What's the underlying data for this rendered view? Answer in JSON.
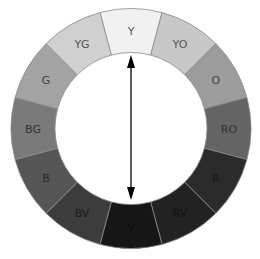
{
  "diagram": {
    "center": [
      131,
      128.5
    ],
    "outer_radius": 120,
    "inner_radius": 76,
    "segments": [
      {
        "label": "Y",
        "fill": "#f1f1f1",
        "text": "#555555"
      },
      {
        "label": "YO",
        "fill": "#c8c8c8",
        "text": "#555555"
      },
      {
        "label": "O",
        "fill": "#9c9c9c",
        "text": "#444444"
      },
      {
        "label": "RO",
        "fill": "#646464",
        "text": "#333333"
      },
      {
        "label": "R",
        "fill": "#2b2b2b",
        "text": "#151515"
      },
      {
        "label": "RV",
        "fill": "#222222",
        "text": "#111111"
      },
      {
        "label": "V",
        "fill": "#161616",
        "text": "#0a0a0a"
      },
      {
        "label": "BV",
        "fill": "#3c3c3c",
        "text": "#1c1c1c"
      },
      {
        "label": "B",
        "fill": "#555555",
        "text": "#2a2a2a"
      },
      {
        "label": "BG",
        "fill": "#7a7a7a",
        "text": "#333333"
      },
      {
        "label": "G",
        "fill": "#a3a3a3",
        "text": "#444444"
      },
      {
        "label": "YG",
        "fill": "#d0d0d0",
        "text": "#555555"
      }
    ],
    "separator_color": "#8a8a8a",
    "arrow": {
      "from": "Y",
      "to": "V",
      "color": "#000000",
      "x": 131,
      "y1": 55,
      "y2": 200
    }
  }
}
